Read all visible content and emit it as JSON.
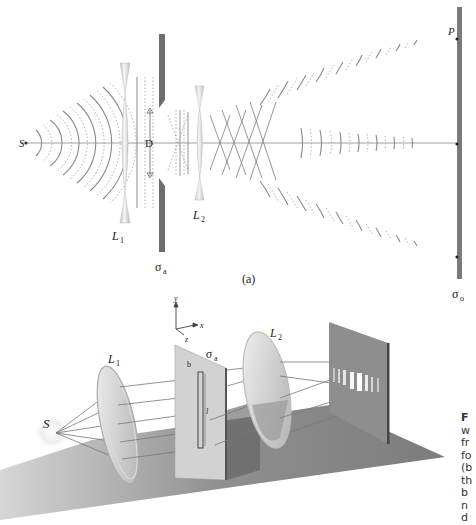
{
  "panel_a": {
    "label": "(a)",
    "source_label": "S",
    "lens1_label": "L",
    "lens1_sub": "1",
    "lens2_label": "L",
    "lens2_sub": "2",
    "aperture_label": "σ",
    "aperture_sub": "a",
    "aperture_width_label": "D",
    "screen_label": "σ",
    "screen_sub": "o",
    "point_label": "P"
  },
  "panel_b": {
    "source_label": "S",
    "lens1_label": "L",
    "lens1_sub": "1",
    "lens2_label": "L",
    "lens2_sub": "2",
    "aperture_label": "σ",
    "aperture_sub": "a",
    "slit_width_label": "b",
    "slit_length_label": "l",
    "axes": {
      "y": "y",
      "x": "x",
      "z": "z"
    }
  },
  "caption": {
    "lines": [
      "F",
      "w",
      "fr",
      "fo",
      "(b",
      "th",
      "b",
      "n",
      "d"
    ]
  },
  "colors": {
    "wave": "#8a8a8a",
    "screen": "#7a7a7a",
    "lens": "#d8d8d8",
    "floor": "#9a9a9a"
  }
}
